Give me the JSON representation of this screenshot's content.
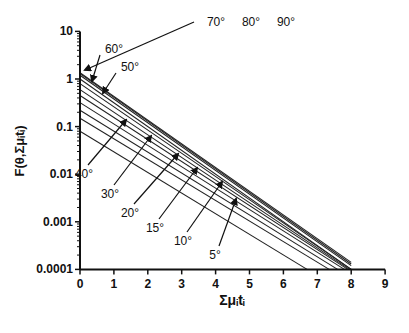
{
  "chart_data": {
    "type": "line",
    "title": "",
    "xlabel": "Σμᵢtᵢ",
    "ylabel": "F(θ,Σμᵢtᵢ)",
    "xlim": [
      0,
      9
    ],
    "ylim": [
      0.0001,
      10
    ],
    "yscale": "log",
    "grid": false,
    "legend": "none (inline arrow annotations)",
    "x_ticks": [
      "0",
      "1",
      "2",
      "3",
      "4",
      "5",
      "6",
      "7",
      "8",
      "9"
    ],
    "y_ticks": [
      "0.0001",
      "0.001",
      "0.01",
      "0.1",
      "1",
      "10"
    ],
    "series": [
      {
        "name": "90°",
        "x": [
          0,
          8
        ],
        "values": [
          1.35,
          0.00014
        ]
      },
      {
        "name": "80°",
        "x": [
          0,
          8
        ],
        "values": [
          1.3,
          0.00013
        ]
      },
      {
        "name": "70°",
        "x": [
          0,
          8
        ],
        "values": [
          1.2,
          0.00012
        ]
      },
      {
        "name": "60°",
        "x": [
          0,
          8
        ],
        "values": [
          1.0,
          0.0001
        ]
      },
      {
        "name": "50°",
        "x": [
          0,
          8
        ],
        "values": [
          0.8,
          0.0001
        ]
      },
      {
        "name": "40°",
        "x": [
          0,
          7.95
        ],
        "values": [
          0.6,
          0.0001
        ]
      },
      {
        "name": "30°",
        "x": [
          0,
          7.9
        ],
        "values": [
          0.45,
          0.0001
        ]
      },
      {
        "name": "20°",
        "x": [
          0,
          7.8
        ],
        "values": [
          0.32,
          0.0001
        ]
      },
      {
        "name": "15°",
        "x": [
          0,
          7.6
        ],
        "values": [
          0.22,
          0.0001
        ]
      },
      {
        "name": "10°",
        "x": [
          0,
          7.35
        ],
        "values": [
          0.15,
          0.0001
        ]
      },
      {
        "name": "5°",
        "x": [
          0,
          6.7
        ],
        "values": [
          0.08,
          0.0001
        ]
      }
    ],
    "annotations": [
      {
        "label": "70°",
        "tx": 216,
        "ty": 26,
        "ax": 85,
        "ay": 70
      },
      {
        "label": "80°",
        "tx": 251,
        "ty": 26
      },
      {
        "label": "90°",
        "tx": 286,
        "ty": 26
      },
      {
        "label": "60°",
        "tx": 114,
        "ty": 53,
        "ax": 92,
        "ay": 81
      },
      {
        "label": "50°",
        "tx": 130,
        "ty": 71,
        "ax": 103,
        "ay": 93
      },
      {
        "label": "40°",
        "tx": 84,
        "ty": 178,
        "ax": 126,
        "ay": 120
      },
      {
        "label": "30°",
        "tx": 110,
        "ty": 198,
        "ax": 151,
        "ay": 136
      },
      {
        "label": "20°",
        "tx": 130,
        "ty": 217,
        "ax": 178,
        "ay": 154
      },
      {
        "label": "15°",
        "tx": 155,
        "ty": 232,
        "ax": 197,
        "ay": 168
      },
      {
        "label": "10°",
        "tx": 183,
        "ty": 245,
        "ax": 222,
        "ay": 182
      },
      {
        "label": "5°",
        "tx": 215,
        "ty": 259,
        "ax": 236,
        "ay": 199
      }
    ]
  }
}
